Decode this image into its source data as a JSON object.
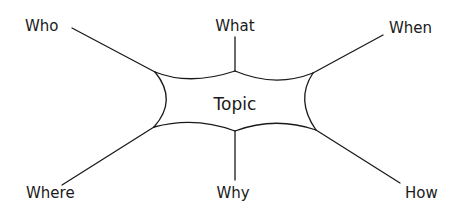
{
  "diagram": {
    "type": "mind-map",
    "center": {
      "label": "Topic"
    },
    "branches": [
      {
        "label": "Who",
        "position": "top-left"
      },
      {
        "label": "What",
        "position": "top-center"
      },
      {
        "label": "When",
        "position": "top-right"
      },
      {
        "label": "Where",
        "position": "bottom-left"
      },
      {
        "label": "Why",
        "position": "bottom-center"
      },
      {
        "label": "How",
        "position": "bottom-right"
      }
    ],
    "colors": {
      "stroke": "#1a1a1a",
      "background": "#ffffff"
    }
  }
}
